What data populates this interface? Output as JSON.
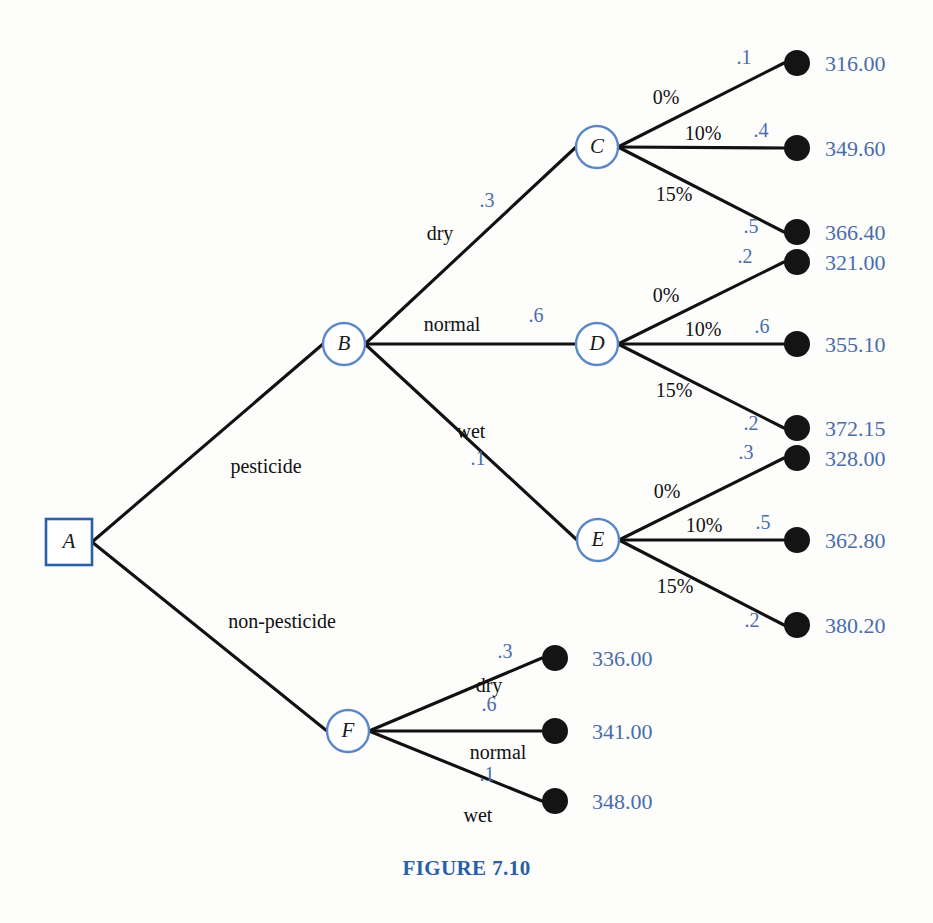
{
  "figure": {
    "caption": "FIGURE 7.10",
    "caption_color": "#2b5fa8",
    "payoff_color": "#4a6cab",
    "line_color": "#111111",
    "node_stroke_color": "#5b87c9",
    "decision_stroke_color": "#2b5fa8"
  },
  "nodes": {
    "a": {
      "label": "A",
      "type": "decision-square",
      "x": 69,
      "y": 542
    },
    "b": {
      "label": "B",
      "type": "chance-circle",
      "x": 344,
      "y": 344
    },
    "c": {
      "label": "C",
      "type": "chance-circle",
      "x": 597,
      "y": 147
    },
    "d": {
      "label": "D",
      "type": "chance-circle",
      "x": 597,
      "y": 344
    },
    "e": {
      "label": "E",
      "type": "chance-circle",
      "x": 598,
      "y": 540
    },
    "f": {
      "label": "F",
      "type": "chance-circle",
      "x": 348,
      "y": 731
    }
  },
  "root_branches": [
    {
      "label": "pesticide",
      "lx": 266,
      "ly": 473
    },
    {
      "label": "non-pesticide",
      "lx": 282,
      "ly": 628
    }
  ],
  "weather_branches_b": [
    {
      "label": "dry",
      "prob": ".3",
      "lx": 440,
      "ly": 240,
      "px": 487,
      "py": 207
    },
    {
      "label": "normal",
      "prob": ".6",
      "lx": 452,
      "ly": 331,
      "px": 536,
      "py": 322
    },
    {
      "label": "wet",
      "prob": ".1",
      "lx": 471,
      "ly": 438,
      "px": 478,
      "py": 465
    }
  ],
  "weather_branches_f": [
    {
      "label": "dry",
      "prob": ".3",
      "lx": 489,
      "ly": 692,
      "px": 505,
      "py": 658
    },
    {
      "label": "normal",
      "prob": ".6",
      "lx": 498,
      "ly": 759,
      "px": 489,
      "py": 711
    },
    {
      "label": "wet",
      "prob": ".1",
      "lx": 478,
      "ly": 822,
      "px": 487,
      "py": 781
    }
  ],
  "chance_outcomes": {
    "c": [
      {
        "rate": "0%",
        "prob": ".1",
        "payoff": "316.00",
        "dot_y": 63,
        "rate_x": 666,
        "rate_y": 104,
        "prob_x": 744,
        "prob_y": 64
      },
      {
        "rate": "10%",
        "prob": ".4",
        "payoff": "349.60",
        "dot_y": 148,
        "rate_x": 703,
        "rate_y": 140,
        "prob_x": 761,
        "prob_y": 137
      },
      {
        "rate": "15%",
        "prob": ".5",
        "payoff": "366.40",
        "dot_y": 232,
        "rate_x": 674,
        "rate_y": 201,
        "prob_x": 751,
        "prob_y": 233
      }
    ],
    "d": [
      {
        "rate": "0%",
        "prob": ".2",
        "payoff": "321.00",
        "dot_y": 262,
        "rate_x": 666,
        "rate_y": 302,
        "prob_x": 745,
        "prob_y": 263
      },
      {
        "rate": "10%",
        "prob": ".6",
        "payoff": "355.10",
        "dot_y": 344,
        "rate_x": 703,
        "rate_y": 336,
        "prob_x": 762,
        "prob_y": 333
      },
      {
        "rate": "15%",
        "prob": ".2",
        "payoff": "372.15",
        "dot_y": 428,
        "rate_x": 674,
        "rate_y": 397,
        "prob_x": 751,
        "prob_y": 430
      }
    ],
    "e": [
      {
        "rate": "0%",
        "prob": ".3",
        "payoff": "328.00",
        "dot_y": 458,
        "rate_x": 667,
        "rate_y": 498,
        "prob_x": 746,
        "prob_y": 459
      },
      {
        "rate": "10%",
        "prob": ".5",
        "payoff": "362.80",
        "dot_y": 540,
        "rate_x": 704,
        "rate_y": 532,
        "prob_x": 763,
        "prob_y": 529
      },
      {
        "rate": "15%",
        "prob": ".2",
        "payoff": "380.20",
        "dot_y": 625,
        "rate_x": 675,
        "rate_y": 593,
        "prob_x": 752,
        "prob_y": 627
      }
    ]
  },
  "f_outcomes": [
    {
      "payoff": "336.00",
      "dot_y": 658
    },
    {
      "payoff": "341.00",
      "dot_y": 731
    },
    {
      "payoff": "348.00",
      "dot_y": 801
    }
  ],
  "geometry": {
    "dot_x_right": 797,
    "dot_x_lower": 555,
    "payoff_x_right": 825,
    "payoff_x_lower": 592,
    "dot_radius": 13,
    "circle_radius": 21,
    "square_half": 23
  }
}
